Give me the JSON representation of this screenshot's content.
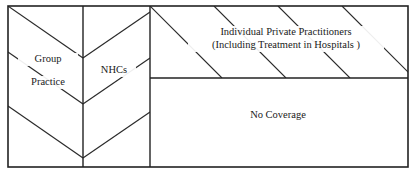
{
  "figure": {
    "type": "schematic-block-diagram",
    "title": "",
    "background_color": "#ffffff",
    "line_color": "#222222",
    "text_color": "#1a1a1a"
  },
  "regions": [
    {
      "id": "group-practice",
      "label_line1": "Group",
      "label_line2": "Practice",
      "fill_pattern": "chevron-diagonal",
      "order": 1
    },
    {
      "id": "nhcs",
      "label_line1": "NHCs",
      "label_line2": "",
      "fill_pattern": "chevron-diagonal",
      "order": 2
    },
    {
      "id": "individual-private-practitioners",
      "label_line1": "Individual Private Practitioners",
      "label_line2": "(Including Treatment in Hospitals  )",
      "fill_pattern": "diagonal-hatch",
      "order": 3
    },
    {
      "id": "no-coverage",
      "label_line1": "No Coverage",
      "label_line2": "",
      "fill_pattern": "none",
      "order": 4
    }
  ],
  "labels": {
    "group": "Group",
    "practice": "Practice",
    "nhcs": "NHCs",
    "ipp_line1": "Individual Private Practitioners",
    "ipp_line2": "(Including Treatment in Hospitals  )",
    "no_coverage": "No Coverage"
  }
}
